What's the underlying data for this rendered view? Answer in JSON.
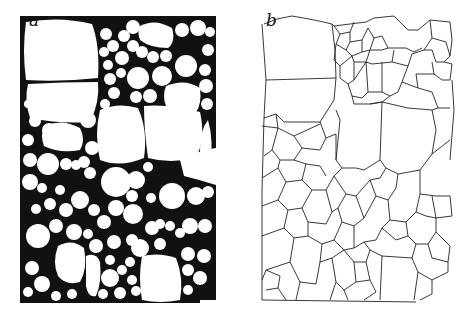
{
  "figure": {
    "panels": [
      {
        "id": "a",
        "label": "a",
        "description": "Foam / emulsion micrograph: white cells with black interstitial regions"
      },
      {
        "id": "b",
        "label": "b",
        "description": "Cell-boundary network (tessellation) traced from panel a"
      }
    ],
    "colors": {
      "background": "#ffffff",
      "ink": "#111111",
      "cell": "#ffffff"
    }
  }
}
